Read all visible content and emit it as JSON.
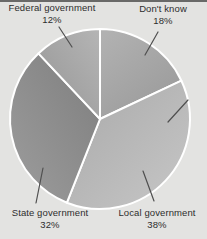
{
  "figure": {
    "kind": "scanned textbook pie chart figure"
  },
  "ui": {
    "background_color": "#e3e3e1",
    "top_rule_color": "#4a4a4a",
    "label_text_color": "#2d2d2d",
    "leader_line_color": "#4f4f4f",
    "divider_color": "#ffffff"
  },
  "chart_data": {
    "type": "pie",
    "legend_position": "callout-labels",
    "direction": "clockwise",
    "start_angle_deg": 0,
    "center": [
      100,
      119
    ],
    "radius": 90,
    "divider_color": "#ffffff",
    "slices": [
      {
        "id": "dont-know",
        "label": "Don't know",
        "value": 18,
        "pct_label": "18%",
        "fill_from": "#b1b1b1",
        "fill_to": "#999999",
        "grad": [
          0.15,
          0,
          0.85,
          1
        ]
      },
      {
        "id": "local-government",
        "label": "Local government",
        "value": 38,
        "pct_label": "38%",
        "fill_from": "#a9a9a9",
        "fill_to": "#c7c7c7",
        "grad": [
          0,
          0,
          1,
          1
        ]
      },
      {
        "id": "state-government",
        "label": "State government",
        "value": 32,
        "pct_label": "32%",
        "fill_from": "#7e7e7e",
        "fill_to": "#9d9d9d",
        "grad": [
          1,
          0,
          0,
          1
        ]
      },
      {
        "id": "federal-government",
        "label": "Federal government",
        "value": 12,
        "pct_label": "12%",
        "fill_from": "#959595",
        "fill_to": "#b5b5b5",
        "grad": [
          0,
          1,
          1,
          0
        ]
      }
    ]
  }
}
